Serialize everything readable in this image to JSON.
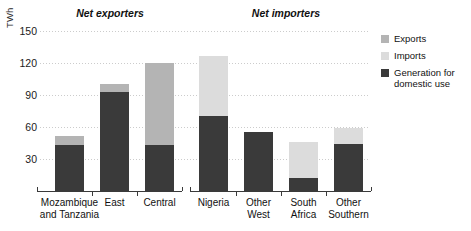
{
  "chart_data": {
    "type": "bar",
    "subtype": "stacked-bar",
    "title": "",
    "xlabel": "",
    "ylabel": "TWh",
    "ylim": [
      0,
      150
    ],
    "yticks": [
      30,
      60,
      90,
      120,
      150
    ],
    "grid": true,
    "legend_position": "right",
    "panels": [
      {
        "name": "Net exporters",
        "categories": [
          "Mozambique\nand Tanzania",
          "East",
          "Central"
        ],
        "series": [
          {
            "name": "Generation for domestic use",
            "values": [
              43,
              93,
              43
            ]
          },
          {
            "name": "Exports",
            "values": [
              9,
              7,
              77
            ]
          },
          {
            "name": "Imports",
            "values": [
              0,
              0,
              0
            ]
          }
        ],
        "totals": [
          52,
          100,
          120
        ]
      },
      {
        "name": "Net importers",
        "categories": [
          "Nigeria",
          "Other\nWest",
          "South\nAfrica",
          "Other\nSouthern"
        ],
        "series": [
          {
            "name": "Generation for domestic use",
            "values": [
              70,
              55,
              12,
              44
            ]
          },
          {
            "name": "Exports",
            "values": [
              0,
              0,
              0,
              0
            ]
          },
          {
            "name": "Imports",
            "values": [
              57,
              0,
              34,
              15
            ]
          }
        ],
        "totals": [
          127,
          55,
          46,
          59
        ]
      }
    ],
    "legend": [
      {
        "label": "Exports",
        "color": "#b4b4b4"
      },
      {
        "label": "Imports",
        "color": "#dcdcdc"
      },
      {
        "label": "Generation for domestic use",
        "color": "#3a3a3a"
      }
    ]
  },
  "axis": {
    "ylabel": "TWh",
    "ticks": [
      {
        "value": 150,
        "label": "150"
      },
      {
        "value": 120,
        "label": "120"
      },
      {
        "value": 90,
        "label": "90"
      },
      {
        "value": 60,
        "label": "60"
      },
      {
        "value": 30,
        "label": "30"
      }
    ]
  },
  "panels": {
    "exporters": {
      "title": "Net exporters",
      "categories": [
        {
          "label": "Mozambique\nand Tanzania"
        },
        {
          "label": "East"
        },
        {
          "label": "Central"
        }
      ]
    },
    "importers": {
      "title": "Net importers",
      "categories": [
        {
          "label": "Nigeria"
        },
        {
          "label": "Other\nWest"
        },
        {
          "label": "South\nAfrica"
        },
        {
          "label": "Other\nSouthern"
        }
      ]
    }
  },
  "legend": {
    "items": [
      {
        "label": "Exports",
        "color": "#b4b4b4"
      },
      {
        "label": "Imports",
        "color": "#dcdcdc"
      },
      {
        "label": "Generation for domestic use",
        "color": "#3a3a3a"
      }
    ]
  },
  "colors": {
    "exports": "#b4b4b4",
    "imports": "#dcdcdc",
    "domestic": "#3a3a3a",
    "grid": "#c9c9c9",
    "axis": "#3a3a3a"
  }
}
